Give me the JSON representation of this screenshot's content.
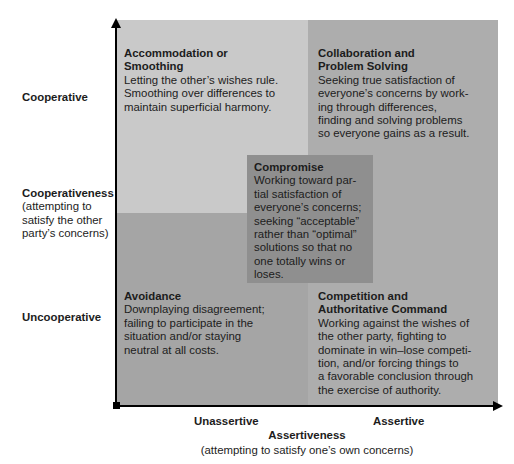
{
  "diagram": {
    "type": "conflict-management-styles-quadrant",
    "y_axis": {
      "title": "Cooperativeness",
      "subtitle": "(attempting to\nsatisfy the other\nparty’s concerns)",
      "high_label": "Cooperative",
      "low_label": "Uncooperative"
    },
    "x_axis": {
      "title": "Assertiveness",
      "subtitle": "(attempting to satisfy one’s own concerns)",
      "low_label": "Unassertive",
      "high_label": "Assertive"
    },
    "quadrants": {
      "top_left": {
        "title": "Accommodation or\nSmoothing",
        "description": "Letting the other’s wishes rule.\nSmoothing over differences to\nmaintain superficial harmony.",
        "color": "#c9c9c9"
      },
      "top_right": {
        "title": "Collaboration and\nProblem Solving",
        "description": "Seeking true satisfaction of\neveryone’s concerns by work-\ning through differences,\nfinding and solving problems\nso everyone gains as a result.",
        "color": "#adadad"
      },
      "bottom_left": {
        "title": "Avoidance",
        "description": "Downplaying disagreement;\nfailing to participate in the\nsituation and/or staying\nneutral at all costs.",
        "color": "#a5a5a5"
      },
      "bottom_right": {
        "title": "Competition and\nAuthoritative Command",
        "description": "Working against the wishes of\nthe other party, fighting to\ndominate in win–lose competi-\ntion, and/or forcing things to\na favorable conclusion through\nthe exercise of authority.",
        "color": "#adadad"
      },
      "center": {
        "title": "Compromise",
        "description": "Working toward par-\ntial satisfaction of\neveryone’s concerns;\nseeking “acceptable”\nrather than “optimal”\nsolutions so that no\none totally wins or\nloses.",
        "color": "#8f8f8f"
      }
    }
  }
}
